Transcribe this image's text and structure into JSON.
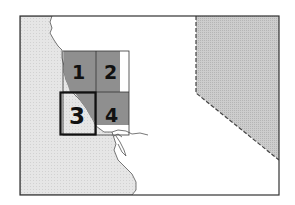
{
  "map": {
    "type": "locator-map",
    "colors": {
      "ocean": "#e4e4e4",
      "land": "#ffffff",
      "neighbor_state": "#c9c9c9",
      "quad_shade": "#8f8f8f",
      "frame": "#333333",
      "coastline": "#555555"
    },
    "quadrants": [
      {
        "label": "1",
        "selected": false
      },
      {
        "label": "2",
        "selected": false
      },
      {
        "label": "3",
        "selected": true
      },
      {
        "label": "4",
        "selected": false
      }
    ]
  }
}
